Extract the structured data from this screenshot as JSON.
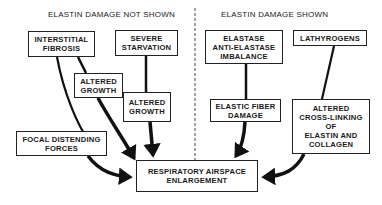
{
  "headers": {
    "left": "ELASTIN DAMAGE NOT SHOWN",
    "right": "ELASTIN DAMAGE SHOWN"
  },
  "nodes": {
    "interstitial_fibrosis": "INTERSTITIAL\nFIBROSIS",
    "severe_starvation": "SEVERE\nSTARVATION",
    "altered_growth_1": "ALTERED\nGROWTH",
    "altered_growth_2": "ALTERED\nGROWTH",
    "focal_distending_forces": "FOCAL DISTENDING\nFORCES",
    "respiratory_airspace_enlargement": "RESPIRATORY AIRSPACE\nENLARGEMENT",
    "elastase_imbalance": "ELASTASE\nANTI-ELASTASE\nIMBALANCE",
    "lathyrogens": "LATHYROGENS",
    "elastic_fiber_damage": "ELASTIC FIBER\nDAMAGE",
    "altered_cross_linking": "ALTERED\nCROSS-LINKING\nOF\nELASTIN AND\nCOLLAGEN"
  },
  "edges": [
    {
      "from": "interstitial_fibrosis",
      "to": "altered_growth_1"
    },
    {
      "from": "interstitial_fibrosis",
      "to": "respiratory_airspace_enlargement"
    },
    {
      "from": "severe_starvation",
      "to": "altered_growth_2"
    },
    {
      "from": "altered_growth_1",
      "to": "respiratory_airspace_enlargement"
    },
    {
      "from": "altered_growth_2",
      "to": "respiratory_airspace_enlargement"
    },
    {
      "from": "focal_distending_forces",
      "to": "respiratory_airspace_enlargement"
    },
    {
      "from": "elastase_imbalance",
      "to": "elastic_fiber_damage"
    },
    {
      "from": "elastic_fiber_damage",
      "to": "respiratory_airspace_enlargement"
    },
    {
      "from": "lathyrogens",
      "to": "altered_cross_linking"
    },
    {
      "from": "altered_cross_linking",
      "to": "respiratory_airspace_enlargement"
    }
  ]
}
